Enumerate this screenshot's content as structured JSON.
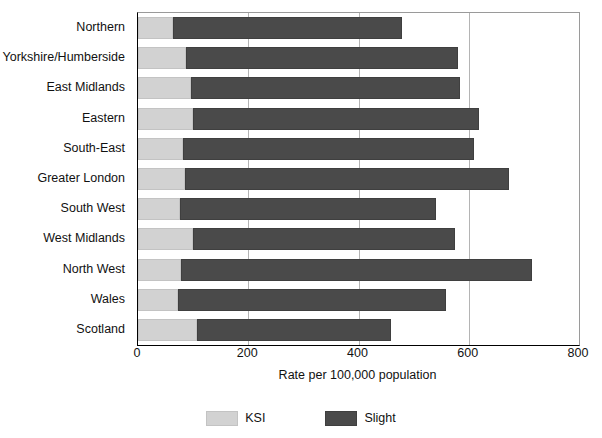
{
  "chart_data": {
    "type": "bar",
    "orientation": "horizontal",
    "stacked": true,
    "title": "",
    "xlabel": "Rate per 100,000 population",
    "ylabel": "",
    "xlim": [
      0,
      800
    ],
    "xticks": [
      0,
      200,
      400,
      600,
      800
    ],
    "xtick_labels": [
      "0",
      "200",
      "400",
      "600",
      "800"
    ],
    "grid": "vertical",
    "legend_position": "bottom",
    "categories": [
      "Northern",
      "Yorkshire/Humberside",
      "East Midlands",
      "Eastern",
      "South-East",
      "Greater London",
      "South West",
      "West Midlands",
      "North West",
      "Wales",
      "Scotland"
    ],
    "series": [
      {
        "name": "KSI",
        "color": "#d2d2d2",
        "values": [
          64,
          87,
          96,
          100,
          82,
          86,
          76,
          100,
          78,
          73,
          107
        ]
      },
      {
        "name": "Slight",
        "color": "#4a4a4a",
        "values": [
          415,
          494,
          488,
          519,
          528,
          587,
          465,
          475,
          637,
          486,
          352
        ]
      }
    ],
    "totals": [
      479,
      581,
      584,
      619,
      610,
      673,
      541,
      575,
      715,
      559,
      459
    ]
  }
}
